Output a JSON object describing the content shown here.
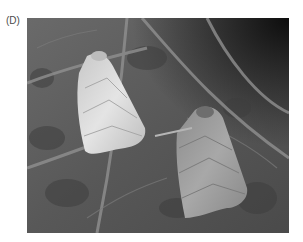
{
  "figure": {
    "panel_label": "(D)",
    "photo": {
      "subject": "two moths resting on a leaf",
      "color_mode": "grayscale",
      "moths": [
        {
          "id": "left",
          "tone": "pale",
          "fill": "#d9d9d9"
        },
        {
          "id": "right",
          "tone": "mid-gray",
          "fill": "#9a9a9a"
        }
      ],
      "background": {
        "leaf": "#5c5c5c",
        "veins": "#8a8a8a",
        "shadow": "#1a1a1a"
      }
    }
  }
}
